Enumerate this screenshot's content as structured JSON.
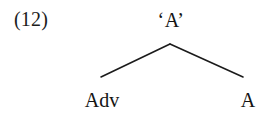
{
  "figure": {
    "example_number": "(12)",
    "type": "syntax-tree",
    "background_color": "#ffffff",
    "text_color": "#141414",
    "line_color": "#1b1b1b"
  },
  "tree": {
    "root": {
      "label": "‘A’",
      "x": 171,
      "y": 22
    },
    "children": [
      {
        "label": "Adv",
        "x": 102,
        "y": 104
      },
      {
        "label": "A",
        "x": 248,
        "y": 104
      }
    ],
    "branches": [
      {
        "name": "left-branch",
        "x1": 170,
        "y1": 44,
        "x2": 101,
        "y2": 77
      },
      {
        "name": "right-branch",
        "x1": 170,
        "y1": 44,
        "x2": 243,
        "y2": 77
      }
    ]
  }
}
